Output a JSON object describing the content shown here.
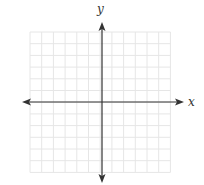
{
  "diagram": {
    "type": "coordinate-plane",
    "x_axis_label": "x",
    "y_axis_label": "y",
    "grid": {
      "columns": 12,
      "rows": 12,
      "left": 30,
      "top": 32,
      "cell": 11.7,
      "line_color": "#e6e6e6"
    },
    "origin": {
      "x": 102,
      "y": 102
    },
    "axis_color": "#333333",
    "x_axis_extent": [
      22,
      184
    ],
    "y_axis_extent": [
      22,
      183
    ]
  }
}
